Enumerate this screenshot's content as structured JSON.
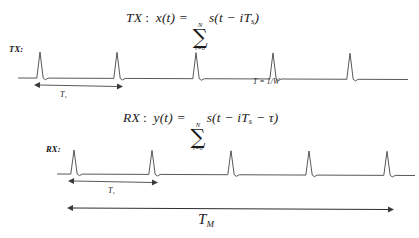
{
  "figure": {
    "background_color": "#ffffff",
    "stroke_color": "#3a3a3a"
  },
  "equations": {
    "tx": {
      "prefix": "TX",
      "colon": ":",
      "lhs": "x(t) =",
      "sum_upper": "N",
      "sum_lower": "i=0",
      "sigma": "∑",
      "rhs_pre": "s(t − iT",
      "rhs_sub": "s",
      "rhs_post": ")"
    },
    "rx": {
      "prefix": "RX",
      "colon": ":",
      "lhs": "y(t) =",
      "sum_upper": "N",
      "sum_lower": "i=0",
      "sigma": "∑",
      "rhs_pre": "s(t − iT",
      "rhs_sub": "s",
      "rhs_mid": " − τ",
      "rhs_post": ")"
    }
  },
  "signals": {
    "tx": {
      "label": "TX:",
      "baseline_y": 78,
      "peak_y": 52,
      "pulse_positions": [
        40,
        117,
        196,
        273,
        350
      ],
      "line_start_x": 18,
      "line_end_x": 408
    },
    "rx": {
      "label": "RX:",
      "baseline_y": 174,
      "peak_y": 150,
      "pulse_positions": [
        74,
        152,
        231,
        309,
        387
      ],
      "line_start_x": 57,
      "line_end_x": 415
    }
  },
  "annotations": {
    "ts_tx": {
      "symbol": "T",
      "subscript": "s",
      "arrow_x_start": 40,
      "arrow_x_end": 117,
      "arrow_y": 85
    },
    "ts_rx": {
      "symbol": "T",
      "subscript": "s",
      "arrow_x_start": 74,
      "arrow_x_end": 152,
      "arrow_y": 181
    },
    "pulse_width": {
      "text": "T = 1/W"
    },
    "tm": {
      "symbol": "T",
      "subscript": "M",
      "arrow_x_start": 73,
      "arrow_x_end": 388,
      "arrow_y": 208
    }
  }
}
